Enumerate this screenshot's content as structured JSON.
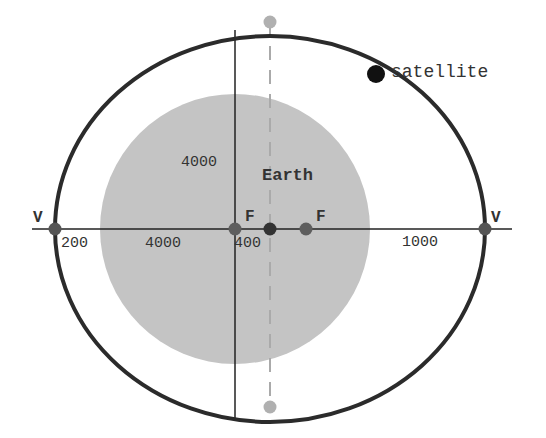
{
  "diagram": {
    "type": "elliptical-orbit",
    "colors": {
      "background": "#ffffff",
      "earth_fill": "#c4c4c4",
      "orbit_stroke": "#2b2b2b",
      "axis_stroke": "#222222",
      "focus_dot": "#5e5e5e",
      "center_dot": "#333333",
      "vertex_dot": "#555555",
      "minor_vertex_dot": "#b0b0b0",
      "satellite_dot": "#111111",
      "dashed_line": "#aaaaaa",
      "text": "#333333"
    },
    "labels": {
      "earth": "Earth",
      "satellite": "satellite",
      "vertex_left": "V",
      "vertex_right": "V",
      "focus_left": "F",
      "focus_right": "F"
    },
    "dimensions": {
      "left_gap": "200",
      "earth_radius_horizontal": "4000",
      "earth_radius_vertical": "4000",
      "focus_to_center": "400",
      "right_gap": "1000"
    },
    "geometry": {
      "axis_horizontal": {
        "x1": 32,
        "x2": 512,
        "y": 229
      },
      "axis_vertical": {
        "x": 235,
        "y1": 30,
        "y2": 418
      },
      "ellipse": {
        "cx": 270,
        "cy": 229,
        "rx": 215,
        "ry": 193
      },
      "earth": {
        "cx": 235,
        "cy": 229,
        "r": 135
      },
      "dashed_line": {
        "x": 270,
        "y1": 22,
        "y2": 407
      },
      "points": {
        "vertex_left": {
          "x": 55,
          "y": 229
        },
        "vertex_right": {
          "x": 485,
          "y": 229
        },
        "focus_left": {
          "x": 235,
          "y": 229
        },
        "center": {
          "x": 270,
          "y": 229
        },
        "focus_right": {
          "x": 306,
          "y": 229
        },
        "minor_top": {
          "x": 270,
          "y": 22
        },
        "minor_bottom": {
          "x": 270,
          "y": 407
        },
        "satellite": {
          "x": 376,
          "y": 74
        }
      }
    }
  }
}
